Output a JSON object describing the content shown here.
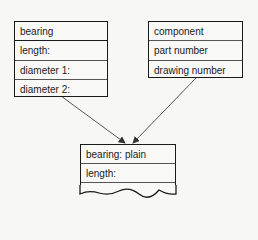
{
  "entities": {
    "bearing": {
      "title": "bearing",
      "attributes": [
        "length:",
        "diameter 1:",
        "diameter 2:"
      ]
    },
    "component": {
      "title": "component",
      "attributes": [
        "part number",
        "drawing number"
      ]
    },
    "bearing_plain": {
      "title": "bearing:  plain",
      "attributes": [
        "length:"
      ]
    }
  },
  "relationships": [
    {
      "from": "bearing",
      "to": "bearing_plain"
    },
    {
      "from": "component",
      "to": "bearing_plain"
    }
  ]
}
